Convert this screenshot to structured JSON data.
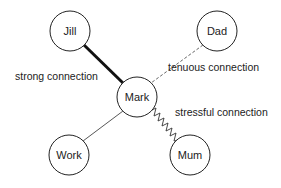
{
  "diagram": {
    "title": "",
    "nodes": [
      {
        "id": "jill",
        "label": "Jill",
        "cx": 70,
        "cy": 31,
        "r": 20
      },
      {
        "id": "dad",
        "label": "Dad",
        "cx": 217,
        "cy": 31,
        "r": 20
      },
      {
        "id": "mark",
        "label": "Mark",
        "cx": 137,
        "cy": 97,
        "r": 20
      },
      {
        "id": "work",
        "label": "Work",
        "cx": 69,
        "cy": 155,
        "r": 20
      },
      {
        "id": "mum",
        "label": "Mum",
        "cx": 190,
        "cy": 155,
        "r": 20
      }
    ],
    "edges": [
      {
        "from": "mark",
        "to": "jill",
        "type": "strong",
        "label": "strong connection"
      },
      {
        "from": "mark",
        "to": "dad",
        "type": "tenuous",
        "label": "tenuous connection"
      },
      {
        "from": "mark",
        "to": "mum",
        "type": "stressful",
        "label": "stressful connection"
      },
      {
        "from": "mark",
        "to": "work",
        "type": "normal",
        "label": ""
      }
    ],
    "labels": {
      "strong": "strong connection",
      "tenuous": "tenuous connection",
      "stressful": "stressful connection"
    },
    "colors": {
      "stroke": "#222222",
      "background": "#ffffff"
    }
  }
}
